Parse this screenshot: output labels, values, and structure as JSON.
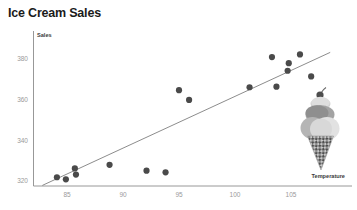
{
  "chart": {
    "title": "Ice Cream Sales",
    "decoration_icon": "ice-cream-cone-icon"
  },
  "chart_data": {
    "type": "scatter",
    "title": "Ice Cream Sales",
    "xlabel": "Temperature",
    "ylabel": "Sales",
    "xlim": [
      82.8,
      108.6
    ],
    "ylim": [
      317.2,
      385.5
    ],
    "grid": false,
    "legend": null,
    "xticks": [
      85,
      90,
      95,
      100,
      105
    ],
    "xtick_labels": [
      "85",
      "90",
      "95",
      "100",
      "105"
    ],
    "yticks": [
      320,
      340,
      360,
      380
    ],
    "ytick_labels": [
      "320",
      "340",
      "360",
      "380"
    ],
    "points": [
      {
        "x": 84.1,
        "y": 321.6
      },
      {
        "x": 84.9,
        "y": 320.6
      },
      {
        "x": 85.7,
        "y": 325.9
      },
      {
        "x": 85.8,
        "y": 322.9
      },
      {
        "x": 88.8,
        "y": 327.7
      },
      {
        "x": 92.1,
        "y": 324.8
      },
      {
        "x": 93.8,
        "y": 324.0
      },
      {
        "x": 95.0,
        "y": 364.3
      },
      {
        "x": 95.9,
        "y": 359.5
      },
      {
        "x": 101.3,
        "y": 365.7
      },
      {
        "x": 103.7,
        "y": 366.0
      },
      {
        "x": 103.3,
        "y": 380.5
      },
      {
        "x": 104.8,
        "y": 377.5
      },
      {
        "x": 104.7,
        "y": 373.8
      },
      {
        "x": 105.8,
        "y": 381.8
      },
      {
        "x": 106.8,
        "y": 371.0
      }
    ],
    "trendline": {
      "type": "linear",
      "x_start": 82.8,
      "y_start": 317.6,
      "x_end": 108.5,
      "y_end": 382.8
    },
    "series": [
      {
        "name": "Sales vs Temperature",
        "marker": "circle",
        "color": "#4a4a4a"
      }
    ]
  },
  "colors": {
    "marker": "#4a4a4a",
    "trendline": "#6e6e6e",
    "axis": "#8c8c8c",
    "tick_text": "#9a9a9a",
    "title_text": "#1b1b1b",
    "axis_title_text": "#3a3a3a"
  }
}
